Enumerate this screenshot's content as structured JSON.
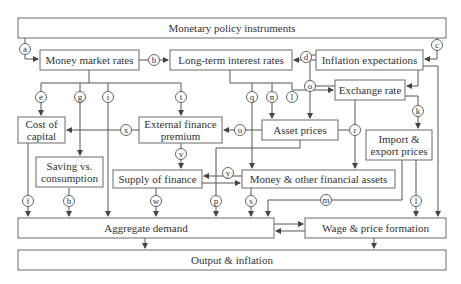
{
  "diagram": {
    "nodes": {
      "instruments": "Monetary policy instruments",
      "money_market": "Money market rates",
      "long_term": "Long-term interest rates",
      "inflation_exp": "Inflation expectations",
      "exchange_rate": "Exchange rate",
      "cost_of_capital_1": "Cost of",
      "cost_of_capital_2": "capital",
      "efp_1": "External finance",
      "efp_2": "premium",
      "asset_prices": "Asset prices",
      "import_export_1": "Import &",
      "import_export_2": "export prices",
      "saving_1": "Saving vs.",
      "saving_2": "consumption",
      "supply_finance": "Supply of finance",
      "money_assets": "Money & other financial assets",
      "aggregate_demand": "Aggregate demand",
      "wage_price": "Wage & price formation",
      "output_inflation": "Output & inflation"
    },
    "channels": {
      "a": "a",
      "b": "b",
      "c": "c",
      "d": "d",
      "e": "e",
      "f": "f",
      "g": "g",
      "h": "h",
      "i": "i",
      "k": "k",
      "l": "l",
      "l2": "l",
      "m": "m",
      "n": "n",
      "o": "o",
      "p": "p",
      "q": "q",
      "r": "r",
      "s": "s",
      "t": "t",
      "u": "u",
      "v": "v",
      "w": "w",
      "x": "x",
      "y": "y"
    },
    "colors": {
      "stroke": "#555555",
      "text": "#333333",
      "background": "#ffffff"
    }
  }
}
